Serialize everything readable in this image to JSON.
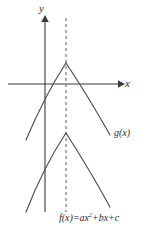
{
  "figure": {
    "background_color": "#ffffff",
    "curve_color": "#4a4a4a",
    "axis_color": "#3a3a3a",
    "dash_color": "#5a5a5a"
  },
  "axes": {
    "y_label": "y",
    "x_label": "x",
    "origin": {
      "x": 45,
      "y": 84
    },
    "x_axis": {
      "start_x": 8,
      "end_x": 122,
      "y": 84,
      "arrow": "right"
    },
    "y_axis": {
      "x": 45,
      "top_y": 18,
      "bottom_y": 212,
      "arrow": "up"
    }
  },
  "symmetry_line": {
    "name": "axis-of-symmetry",
    "x": 66,
    "top_y": 18,
    "bottom_y": 212,
    "style": "dashed"
  },
  "labels": {
    "g_label": "g(x)",
    "f_equation_prefix": "f(x)",
    "f_equation_equals": "=",
    "f_equation_term1_coef": "a",
    "f_equation_term1_var": "x",
    "f_equation_term1_exp": "2",
    "f_equation_plus1": "+",
    "f_equation_term2_coef": "b",
    "f_equation_term2_var": "x",
    "f_equation_plus2": "+",
    "f_equation_term3": "c",
    "f_equation_full": "f(x) = ax2 + bx + c"
  },
  "chart_data": {
    "type": "line",
    "title": "",
    "xlabel": "x",
    "ylabel": "y",
    "grid": false,
    "legend": "inline-annotations",
    "axis_of_symmetry_x": 66,
    "series": [
      {
        "name": "g(x)",
        "shape": "downward parabola",
        "vertex": {
          "x": 66,
          "y": 63
        },
        "left_endpoint": {
          "x": 26,
          "y": 140
        },
        "right_endpoint": {
          "x": 110,
          "y": 135
        },
        "path": "M 26 140 Q 45 95 66 63 Q 88 96 110 135",
        "label_position": {
          "x": 114,
          "y": 128
        }
      },
      {
        "name": "f(x)",
        "shape": "downward parabola",
        "vertex": {
          "x": 66,
          "y": 133
        },
        "left_endpoint": {
          "x": 26,
          "y": 212
        },
        "right_endpoint": {
          "x": 110,
          "y": 207
        },
        "path": "M 26 212 Q 44 166 66 133 Q 88 167 110 207",
        "label_position": {
          "x": 59,
          "y": 213
        }
      }
    ],
    "annotations": [
      {
        "text": "g(x)",
        "x": 114,
        "y": 128
      },
      {
        "text": "f(x) = ax2 + bx + c",
        "x": 59,
        "y": 213
      }
    ]
  }
}
